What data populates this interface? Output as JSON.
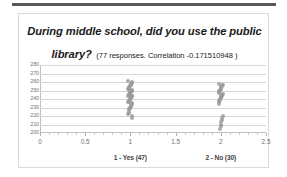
{
  "document": {
    "top_rule_color": "#595959"
  },
  "chart_box": {
    "border_color": "#d9d9d9",
    "background": "#ffffff"
  },
  "chart_data": {
    "type": "scatter",
    "title": "During middle school, did you use the public library?",
    "subtitle": "(77 responses. Correlation -0.171510948 )",
    "title_parts": {
      "question": "During middle school, did you use the public library?",
      "annotation": "(77 responses. Correlation -0.171510948 )"
    },
    "xlabel": "",
    "ylabel": "",
    "xlim": [
      0,
      2.5
    ],
    "ylim": [
      200,
      280
    ],
    "xticks": [
      0,
      0.5,
      1,
      1.5,
      2,
      2.5
    ],
    "xtick_labels": [
      "0",
      "0.5",
      "1",
      "1.5",
      "2",
      "2.5"
    ],
    "yticks": [
      200,
      210,
      220,
      230,
      240,
      250,
      260,
      270,
      280
    ],
    "ytick_labels": [
      "200",
      "210",
      "220",
      "230",
      "240",
      "250",
      "260",
      "270",
      "280"
    ],
    "grid": "horizontal",
    "legend": "none",
    "marker_color": "#9b9b9b",
    "gridline_color": "#d6d6d6",
    "category_labels": [
      {
        "x": 1,
        "text": "1 - Yes (47)",
        "count": 47
      },
      {
        "x": 2,
        "text": "2 - No (30)",
        "count": 30
      }
    ],
    "series": [
      {
        "name": "1 - Yes (47)",
        "x": 1,
        "count": 47,
        "values": [
          261,
          260,
          259,
          258,
          257,
          256,
          255,
          255,
          254,
          253,
          252,
          252,
          251,
          250,
          250,
          249,
          248,
          248,
          247,
          246,
          245,
          245,
          244,
          243,
          243,
          242,
          241,
          241,
          240,
          239,
          238,
          238,
          237,
          236,
          235,
          234,
          233,
          232,
          231,
          230,
          229,
          228,
          226,
          224,
          222,
          220,
          218
        ]
      },
      {
        "name": "2 - No (30)",
        "x": 2,
        "count": 30,
        "values": [
          258,
          257,
          256,
          255,
          254,
          253,
          252,
          251,
          250,
          249,
          248,
          247,
          246,
          245,
          244,
          243,
          242,
          241,
          240,
          239,
          238,
          236,
          234,
          220,
          218,
          215,
          213,
          210,
          208,
          205
        ]
      }
    ]
  }
}
